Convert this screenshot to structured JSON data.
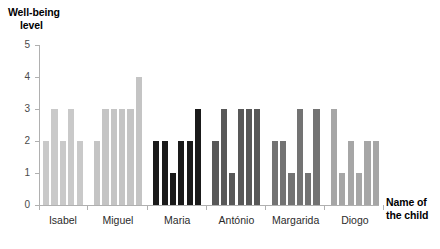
{
  "chart_data": {
    "type": "bar",
    "title": "",
    "ylabel": "Well-being level",
    "xlabel": "Name of the child",
    "ylim": [
      0,
      5
    ],
    "yticks": [
      0,
      1,
      2,
      3,
      4,
      5
    ],
    "ytick_labels": [
      "0",
      "1",
      "2",
      "3",
      "4",
      "5"
    ],
    "grid": false,
    "legend": "none",
    "categories": [
      "Isabel",
      "Miguel",
      "Maria",
      "António",
      "Margarida",
      "Diogo"
    ],
    "groups": [
      {
        "label": "Isabel",
        "color": "#c9c9c9",
        "values": [
          2,
          3,
          2,
          3,
          2
        ]
      },
      {
        "label": "Miguel",
        "color": "#c4c4c4",
        "values": [
          2,
          3,
          3,
          3,
          3,
          4
        ]
      },
      {
        "label": "Maria",
        "color": "#1a1a1a",
        "values": [
          2,
          2,
          1,
          2,
          2,
          3
        ]
      },
      {
        "label": "António",
        "color": "#585858",
        "values": [
          2,
          3,
          1,
          3,
          3,
          3
        ]
      },
      {
        "label": "Margarida",
        "color": "#737373",
        "values": [
          2,
          2,
          1,
          3,
          1,
          3
        ]
      },
      {
        "label": "Diogo",
        "color": "#a6a6a6",
        "values": [
          3,
          1,
          2,
          1,
          2,
          2
        ]
      }
    ]
  },
  "axes": {
    "y_title_line1": "Well-being",
    "y_title_line2": "level",
    "x_title_line1": "Name of",
    "x_title_line2": "the child"
  }
}
